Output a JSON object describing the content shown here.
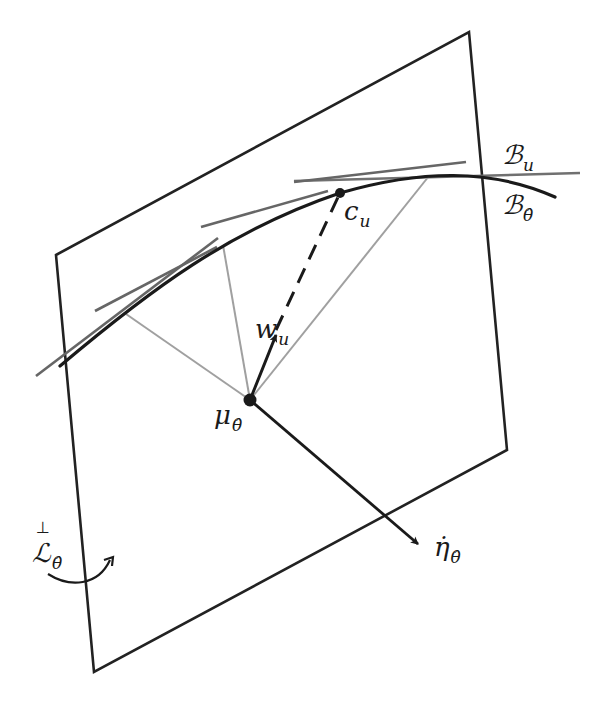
{
  "figure": {
    "type": "geometric-diagram",
    "colors": {
      "plane": "#222222",
      "curve": "#1a1a1a",
      "tangent": "#666666",
      "projection": "#9a9a9a",
      "vector": "#1a1a1a"
    }
  },
  "labels": {
    "B_u": {
      "main": "ℬ",
      "sub": "u"
    },
    "B_theta": {
      "main": "ℬ",
      "sub": "θ̂"
    },
    "c_u": {
      "main": "c",
      "sub": "u"
    },
    "w_u": {
      "main": "w",
      "sub": "u"
    },
    "mu_theta": {
      "main": "μ",
      "sub": "θ̂"
    },
    "eta_dot_theta": {
      "main": "η̇",
      "sub": "θ̂"
    },
    "L_perp_theta": {
      "main": "ℒ",
      "sub": "θ̂",
      "sup": "⊥"
    }
  },
  "geometry": {
    "plane_corners": [
      [
        56,
        255
      ],
      [
        469,
        32
      ],
      [
        507,
        450
      ],
      [
        94,
        672
      ]
    ],
    "point_mu": [
      250,
      400
    ],
    "point_c": [
      340,
      193
    ]
  }
}
